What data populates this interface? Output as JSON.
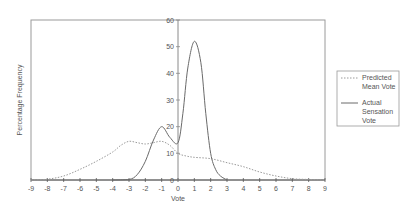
{
  "chart_data": {
    "type": "line",
    "title": "",
    "xlabel": "Vote",
    "ylabel": "Percentage Frequency",
    "xlim": [
      -9,
      9
    ],
    "ylim": [
      0,
      60
    ],
    "x_ticks": [
      "-9",
      "-8",
      "-7",
      "-6",
      "-5",
      "-4",
      "-3",
      "-2",
      "-1",
      "0",
      "1",
      "2",
      "3",
      "4",
      "5",
      "6",
      "7",
      "8",
      "9"
    ],
    "y_ticks": [
      "0",
      "10",
      "20",
      "30",
      "40",
      "50",
      "60"
    ],
    "grid": false,
    "legend_position": "right",
    "series": [
      {
        "name": "Predicted Mean Vote",
        "style": "dotted",
        "color": "#9a9a9a",
        "points": [
          [
            -9,
            0
          ],
          [
            -8,
            0.3
          ],
          [
            -7,
            1.5
          ],
          [
            -6,
            4
          ],
          [
            -5,
            7
          ],
          [
            -4,
            10.5
          ],
          [
            -3.5,
            13
          ],
          [
            -3,
            14.5
          ],
          [
            -2.5,
            14
          ],
          [
            -2,
            13.5
          ],
          [
            -1.5,
            14
          ],
          [
            -1,
            14.5
          ],
          [
            -0.5,
            13
          ],
          [
            0,
            10
          ],
          [
            0.5,
            9
          ],
          [
            1,
            8.5
          ],
          [
            2,
            8
          ],
          [
            3,
            6.5
          ],
          [
            4,
            5
          ],
          [
            5,
            3
          ],
          [
            6,
            1.5
          ],
          [
            7,
            0.5
          ],
          [
            8,
            0.2
          ],
          [
            9,
            0
          ]
        ]
      },
      {
        "name": "Actual Sensation Vote",
        "style": "solid",
        "color": "#6a6a6a",
        "points": [
          [
            -4,
            0
          ],
          [
            -3,
            0.2
          ],
          [
            -2.5,
            2
          ],
          [
            -2,
            7
          ],
          [
            -1.5,
            15
          ],
          [
            -1,
            20
          ],
          [
            -0.5,
            16
          ],
          [
            0,
            14
          ],
          [
            0.3,
            25
          ],
          [
            0.6,
            42
          ],
          [
            1,
            52
          ],
          [
            1.4,
            44
          ],
          [
            1.7,
            25
          ],
          [
            2,
            10
          ],
          [
            2.3,
            4
          ],
          [
            2.6,
            1.5
          ],
          [
            3,
            0
          ]
        ]
      }
    ]
  },
  "legend": {
    "items": [
      {
        "line1": "Predicted",
        "line2": "Mean Vote",
        "line3": ""
      },
      {
        "line1": "Actual",
        "line2": "Sensation",
        "line3": "Vote"
      }
    ]
  },
  "colors": {
    "frame": "#8c8c8c",
    "axis": "#555555",
    "text": "#555555"
  }
}
